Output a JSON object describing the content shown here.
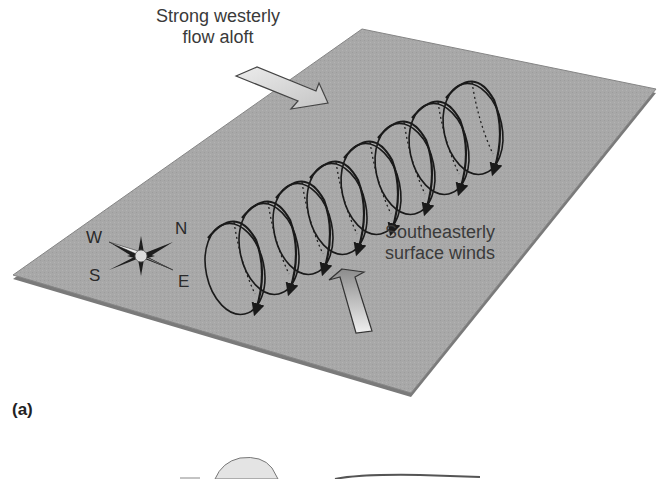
{
  "figure": {
    "panel_label": "(a)",
    "colors": {
      "plane_fill": "#a9a9a9",
      "plane_edge": "#7d7d7d",
      "background": "#ffffff",
      "vortex_line": "#1a1a1a",
      "arrow_fill_light": "#e6e6e6",
      "arrow_fill_dark": "#9a9a9a",
      "text": "#3a3a3a"
    },
    "labels": {
      "aloft_line1": "Strong westerly",
      "aloft_line2": "flow aloft",
      "surface_line1": "Southeasterly",
      "surface_line2": "surface winds"
    },
    "compass": {
      "north": "N",
      "south": "S",
      "east": "E",
      "west": "W"
    },
    "vortex_loop_count": 8
  }
}
